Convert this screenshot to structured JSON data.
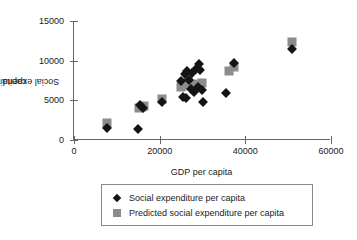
{
  "chart_data": {
    "type": "scatter",
    "title": "",
    "xlabel": "GDP per capita",
    "ylabel": "Social expenditure per capita",
    "ylabel_lines": [
      "Social expenditure per",
      "capita"
    ],
    "xlim": [
      0,
      60000
    ],
    "ylim": [
      0,
      15000
    ],
    "xticks": [
      0,
      20000,
      40000,
      60000
    ],
    "yticks": [
      0,
      5000,
      10000,
      15000
    ],
    "xtick_labels": [
      "0",
      "20000",
      "40000",
      "60000"
    ],
    "ytick_labels": [
      "0",
      "5000",
      "10000",
      "15000"
    ],
    "grid": false,
    "legend_position": "below-center",
    "colors": {
      "actual_marker": "#141414",
      "predicted_marker": "#8c8c8c",
      "axis": "#666666",
      "legend_border": "#8a8a8a",
      "background": "#ffffff"
    },
    "series": [
      {
        "name": "Social expenditure per capita",
        "marker": "diamond",
        "color": "#141414",
        "points": [
          {
            "x": 7600,
            "y": 1450
          },
          {
            "x": 15000,
            "y": 1350
          },
          {
            "x": 15400,
            "y": 4350
          },
          {
            "x": 16200,
            "y": 4050
          },
          {
            "x": 20600,
            "y": 4750
          },
          {
            "x": 24900,
            "y": 7450
          },
          {
            "x": 25400,
            "y": 5450
          },
          {
            "x": 25900,
            "y": 8300
          },
          {
            "x": 26200,
            "y": 5250
          },
          {
            "x": 26400,
            "y": 8650
          },
          {
            "x": 26900,
            "y": 7600
          },
          {
            "x": 27200,
            "y": 6400
          },
          {
            "x": 27600,
            "y": 8400
          },
          {
            "x": 28000,
            "y": 6050
          },
          {
            "x": 28400,
            "y": 9000
          },
          {
            "x": 28900,
            "y": 6700
          },
          {
            "x": 29200,
            "y": 9600
          },
          {
            "x": 29500,
            "y": 8850
          },
          {
            "x": 29900,
            "y": 6250
          },
          {
            "x": 30100,
            "y": 4750
          },
          {
            "x": 35500,
            "y": 5900
          },
          {
            "x": 37300,
            "y": 9750
          },
          {
            "x": 51000,
            "y": 11500
          }
        ]
      },
      {
        "name": "Predicted social expenditure per capita",
        "marker": "square",
        "color": "#8c8c8c",
        "points": [
          {
            "x": 7600,
            "y": 2100
          },
          {
            "x": 15200,
            "y": 4000
          },
          {
            "x": 15800,
            "y": 4200
          },
          {
            "x": 16400,
            "y": 4300
          },
          {
            "x": 20600,
            "y": 5150
          },
          {
            "x": 24900,
            "y": 6700
          },
          {
            "x": 25600,
            "y": 6900
          },
          {
            "x": 26200,
            "y": 7000
          },
          {
            "x": 26700,
            "y": 7700
          },
          {
            "x": 27200,
            "y": 6850
          },
          {
            "x": 27700,
            "y": 7100
          },
          {
            "x": 28200,
            "y": 6800
          },
          {
            "x": 28700,
            "y": 6650
          },
          {
            "x": 29300,
            "y": 6900
          },
          {
            "x": 29900,
            "y": 7200
          },
          {
            "x": 36100,
            "y": 8750
          },
          {
            "x": 37400,
            "y": 9200
          },
          {
            "x": 51000,
            "y": 12350
          }
        ]
      }
    ]
  },
  "legend": {
    "items": [
      {
        "label": "Social expenditure per capita",
        "marker": "diamond"
      },
      {
        "label": "Predicted social expenditure per capita",
        "marker": "square"
      }
    ]
  }
}
